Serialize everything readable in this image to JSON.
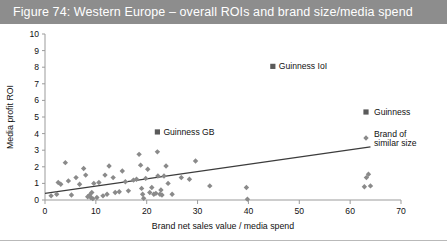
{
  "figure": {
    "title": "Figure 74: Western Europe – overall ROIs and brand size/media spend",
    "banner_color": "#8d8d8d",
    "banner_text_color": "#ffffff"
  },
  "chart_data": {
    "type": "scatter",
    "title": "Figure 74: Western Europe – overall ROIs and brand size/media spend",
    "xlabel": "Brand net sales value / media spend",
    "ylabel": "Media profit ROI",
    "xlim": [
      0,
      70
    ],
    "ylim": [
      0,
      10
    ],
    "xticks": [
      0,
      10,
      20,
      30,
      40,
      50,
      60,
      70
    ],
    "yticks": [
      0,
      1,
      2,
      3,
      4,
      5,
      6,
      7,
      8,
      9,
      10
    ],
    "grid": false,
    "legend_position": "right",
    "marker_color": "#8a8a8a",
    "guinness_marker_color": "#5a5a5a",
    "trend_color": "#3c3c3c",
    "legend": [
      {
        "label": "Guinness",
        "marker": "square",
        "color": "#5a5a5a"
      },
      {
        "label": "Brand of similar size",
        "marker": "diamond",
        "color": "#8a8a8a"
      }
    ],
    "annotations": [
      {
        "text": "Guinness IoI",
        "x": 44.8,
        "y": 8.05
      },
      {
        "text": "Guinness GB",
        "x": 22.1,
        "y": 4.1
      }
    ],
    "series": [
      {
        "name": "Guinness",
        "marker": "square",
        "points": [
          {
            "x": 44.8,
            "y": 8.05,
            "label": "Guinness IoI"
          },
          {
            "x": 22.1,
            "y": 4.1,
            "label": "Guinness GB"
          }
        ]
      },
      {
        "name": "Brand of similar size",
        "marker": "diamond",
        "points": [
          {
            "x": 1.2,
            "y": 0.25
          },
          {
            "x": 2.3,
            "y": 0.35
          },
          {
            "x": 2.6,
            "y": 1.05
          },
          {
            "x": 3.1,
            "y": 0.95
          },
          {
            "x": 4.0,
            "y": 2.25
          },
          {
            "x": 4.6,
            "y": 1.15
          },
          {
            "x": 5.2,
            "y": 0.3
          },
          {
            "x": 6.1,
            "y": 1.35
          },
          {
            "x": 6.8,
            "y": 0.95
          },
          {
            "x": 7.6,
            "y": 1.9
          },
          {
            "x": 8.0,
            "y": 1.5
          },
          {
            "x": 8.4,
            "y": 0.2
          },
          {
            "x": 8.8,
            "y": 0.3
          },
          {
            "x": 9.0,
            "y": 0.15
          },
          {
            "x": 9.2,
            "y": 0.45
          },
          {
            "x": 9.4,
            "y": 0.08
          },
          {
            "x": 9.6,
            "y": 1.0
          },
          {
            "x": 10.2,
            "y": 0.15
          },
          {
            "x": 10.6,
            "y": 1.05
          },
          {
            "x": 11.4,
            "y": 0.25
          },
          {
            "x": 11.8,
            "y": 1.5
          },
          {
            "x": 12.2,
            "y": 0.35
          },
          {
            "x": 12.6,
            "y": 2.05
          },
          {
            "x": 13.4,
            "y": 1.35
          },
          {
            "x": 13.8,
            "y": 0.45
          },
          {
            "x": 14.6,
            "y": 0.5
          },
          {
            "x": 15.2,
            "y": 1.75
          },
          {
            "x": 15.8,
            "y": 1.1
          },
          {
            "x": 16.4,
            "y": 0.55
          },
          {
            "x": 17.4,
            "y": 1.2
          },
          {
            "x": 18.0,
            "y": 1.25
          },
          {
            "x": 18.5,
            "y": 2.75
          },
          {
            "x": 18.8,
            "y": 2.1
          },
          {
            "x": 19.0,
            "y": 0.7
          },
          {
            "x": 19.2,
            "y": 0.35
          },
          {
            "x": 19.4,
            "y": 0.1
          },
          {
            "x": 19.8,
            "y": 1.3
          },
          {
            "x": 20.2,
            "y": 1.85
          },
          {
            "x": 20.6,
            "y": 0.45
          },
          {
            "x": 21.0,
            "y": 0.75
          },
          {
            "x": 21.4,
            "y": 0.35
          },
          {
            "x": 21.8,
            "y": 0.4
          },
          {
            "x": 22.1,
            "y": 2.9
          },
          {
            "x": 22.2,
            "y": 1.45
          },
          {
            "x": 22.6,
            "y": 0.35
          },
          {
            "x": 22.8,
            "y": 0.6
          },
          {
            "x": 23.0,
            "y": 0.3
          },
          {
            "x": 23.4,
            "y": 1.45
          },
          {
            "x": 23.8,
            "y": 2.05
          },
          {
            "x": 24.2,
            "y": 1.0
          },
          {
            "x": 25.0,
            "y": 0.35
          },
          {
            "x": 26.8,
            "y": 1.35
          },
          {
            "x": 28.4,
            "y": 1.25
          },
          {
            "x": 29.6,
            "y": 2.35
          },
          {
            "x": 32.4,
            "y": 0.85
          },
          {
            "x": 39.6,
            "y": 0.75
          },
          {
            "x": 39.8,
            "y": 0.05
          },
          {
            "x": 63.2,
            "y": 1.35
          },
          {
            "x": 63.6,
            "y": 1.55
          },
          {
            "x": 64.0,
            "y": 0.85
          },
          {
            "x": 62.8,
            "y": 0.8
          }
        ]
      }
    ]
  }
}
